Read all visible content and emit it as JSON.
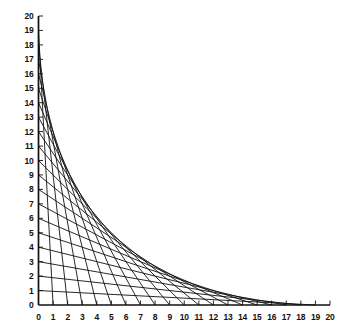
{
  "figure": {
    "name": "hyperbola-envelope-line-graph",
    "background_color": "#ffffff",
    "line_color": "#111111",
    "axis_color": "#111111"
  },
  "chart_data": {
    "type": "line",
    "title": "",
    "subtitle": "",
    "xlabel": "",
    "ylabel": "",
    "xlim": [
      0,
      20
    ],
    "ylim": [
      0,
      20
    ],
    "grid": false,
    "legend": false,
    "x_ticks": [
      0,
      1,
      2,
      3,
      4,
      5,
      6,
      7,
      8,
      9,
      10,
      11,
      12,
      13,
      14,
      15,
      16,
      17,
      18,
      19,
      20
    ],
    "y_ticks": [
      0,
      1,
      2,
      3,
      4,
      5,
      6,
      7,
      8,
      9,
      10,
      11,
      12,
      13,
      14,
      15,
      16,
      17,
      18,
      19,
      20
    ],
    "x_tick_labels": [
      "0",
      "1",
      "2",
      "3",
      "4",
      "5",
      "6",
      "7",
      "8",
      "9",
      "10",
      "11",
      "12",
      "13",
      "14",
      "15",
      "16",
      "17",
      "18",
      "19",
      "20"
    ],
    "y_tick_labels": [
      "0",
      "1",
      "2",
      "3",
      "4",
      "5",
      "6",
      "7",
      "8",
      "9",
      "10",
      "11",
      "12",
      "13",
      "14",
      "15",
      "16",
      "17",
      "18",
      "19",
      "20"
    ],
    "series": [
      {
        "name": "segment-k1",
        "x": [
          0,
          19
        ],
        "y": [
          1,
          0
        ]
      },
      {
        "name": "segment-k2",
        "x": [
          0,
          18
        ],
        "y": [
          2,
          0
        ]
      },
      {
        "name": "segment-k3",
        "x": [
          0,
          17
        ],
        "y": [
          3,
          0
        ]
      },
      {
        "name": "segment-k4",
        "x": [
          0,
          16
        ],
        "y": [
          4,
          0
        ]
      },
      {
        "name": "segment-k5",
        "x": [
          0,
          15
        ],
        "y": [
          5,
          0
        ]
      },
      {
        "name": "segment-k6",
        "x": [
          0,
          14
        ],
        "y": [
          6,
          0
        ]
      },
      {
        "name": "segment-k7",
        "x": [
          0,
          13
        ],
        "y": [
          7,
          0
        ]
      },
      {
        "name": "segment-k8",
        "x": [
          0,
          12
        ],
        "y": [
          8,
          0
        ]
      },
      {
        "name": "segment-k9",
        "x": [
          0,
          11
        ],
        "y": [
          9,
          0
        ]
      },
      {
        "name": "segment-k10",
        "x": [
          0,
          10
        ],
        "y": [
          10,
          0
        ]
      },
      {
        "name": "segment-k11",
        "x": [
          0,
          9
        ],
        "y": [
          11,
          0
        ]
      },
      {
        "name": "segment-k12",
        "x": [
          0,
          8
        ],
        "y": [
          12,
          0
        ]
      },
      {
        "name": "segment-k13",
        "x": [
          0,
          7
        ],
        "y": [
          13,
          0
        ]
      },
      {
        "name": "segment-k14",
        "x": [
          0,
          6
        ],
        "y": [
          14,
          0
        ]
      },
      {
        "name": "segment-k15",
        "x": [
          0,
          5
        ],
        "y": [
          15,
          0
        ]
      },
      {
        "name": "segment-k16",
        "x": [
          0,
          4
        ],
        "y": [
          16,
          0
        ]
      },
      {
        "name": "segment-k17",
        "x": [
          0,
          3
        ],
        "y": [
          17,
          0
        ]
      },
      {
        "name": "segment-k18",
        "x": [
          0,
          2
        ],
        "y": [
          18,
          0
        ]
      },
      {
        "name": "segment-k19",
        "x": [
          0,
          1
        ],
        "y": [
          19,
          0
        ]
      },
      {
        "name": "segment-k20",
        "x": [
          0,
          0
        ],
        "y": [
          20,
          0
        ]
      }
    ]
  }
}
